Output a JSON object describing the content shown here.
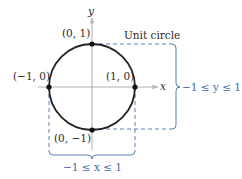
{
  "diagram": {
    "title": "Unit circle",
    "axes": {
      "x_label": "x",
      "y_label": "y"
    },
    "points": [
      {
        "id": "top",
        "label": "(0, 1)"
      },
      {
        "id": "left",
        "label": "(−1, 0)"
      },
      {
        "id": "right",
        "label": "(1, 0)"
      },
      {
        "id": "bottom",
        "label": "(0, −1)"
      }
    ],
    "ranges": {
      "y_range": "−1 ≤ y ≤ 1",
      "x_range": "−1 ≤ x ≤ 1"
    },
    "colors": {
      "circle": "#222222",
      "axes": "#9a9a9a",
      "bracket": "#4a72ad"
    }
  }
}
